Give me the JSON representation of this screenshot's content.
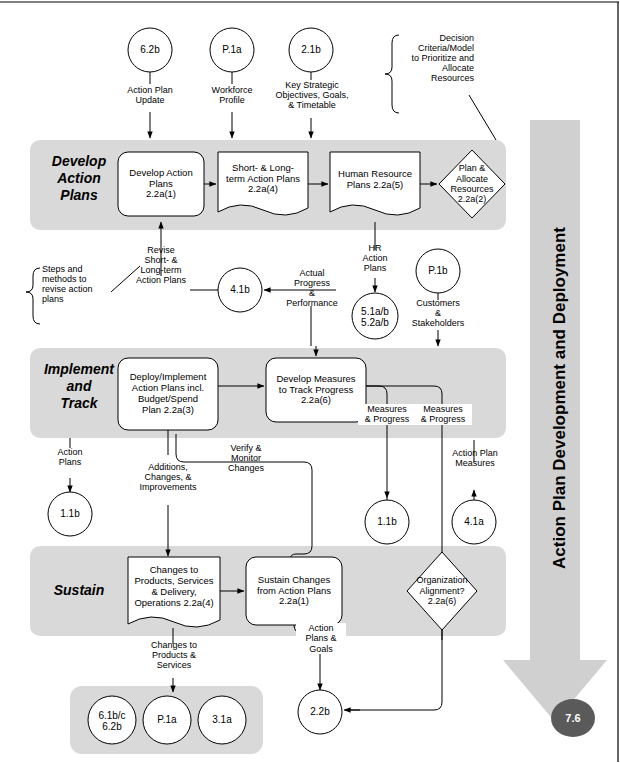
{
  "diagram": {
    "vertical_title": "Action Plan Development and Deployment",
    "end_node": "7.6",
    "colors": {
      "band_fill": "#d9d9d9",
      "arrow_fill": "#d0d0d0",
      "end_node_fill": "#5a5a5a",
      "node_stroke": "#000000",
      "node_fill": "#ffffff"
    }
  },
  "bands": [
    {
      "label": "Develop\nAction\nPlans"
    },
    {
      "label": "Implement\nand\nTrack"
    },
    {
      "label": "Sustain"
    }
  ],
  "band_labels": {
    "develop_l1": "Develop",
    "develop_l2": "Action",
    "develop_l3": "Plans",
    "implement_l1": "Implement",
    "implement_l2": "and",
    "implement_l3": "Track",
    "sustain": "Sustain"
  },
  "top_inputs": [
    {
      "id": "6.2b",
      "label": "Action Plan\nUpdate",
      "label_l1": "Action Plan",
      "label_l2": "Update"
    },
    {
      "id": "P.1a",
      "label": "Workforce\nProfile",
      "label_l1": "Workforce",
      "label_l2": "Profile"
    },
    {
      "id": "2.1b",
      "label": "Key Strategic\nObjectives, Goals,\n& Timetable",
      "label_l1": "Key Strategic",
      "label_l2": "Objectives, Goals,",
      "label_l3": "& Timetable"
    }
  ],
  "annotations": {
    "decision_criteria_l1": "Decision",
    "decision_criteria_l2": "Criteria/Model",
    "decision_criteria_l3": "to Prioritize and",
    "decision_criteria_l4": "Allocate",
    "decision_criteria_l5": "Resources",
    "steps_methods_l1": "Steps and",
    "steps_methods_l2": "methods to",
    "steps_methods_l3": "revise action",
    "steps_methods_l4": "plans"
  },
  "process_nodes": {
    "develop_action_plans": {
      "l1": "Develop Action",
      "l2": "Plans",
      "l3": "2.2a(1)"
    },
    "short_long_action_plans": {
      "l1": "Short- & Long-",
      "l2": "term Action Plans",
      "l3": "2.2a(4)"
    },
    "human_resource_plans": {
      "l1": "Human Resource",
      "l2": "Plans 2.2a(5)"
    },
    "plan_allocate_resources": {
      "l1": "Plan &",
      "l2": "Allocate",
      "l3": "Resources",
      "l4": "2.2a(2)"
    },
    "deploy_implement": {
      "l1": "Deploy/Implement",
      "l2": "Action Plans incl.",
      "l3": "Budget/Spend",
      "l4": "Plan 2.2a(3)"
    },
    "develop_measures": {
      "l1": "Develop Measures",
      "l2": "to Track Progress",
      "l3": "2.2a(6)"
    },
    "changes_to_products": {
      "l1": "Changes to",
      "l2": "Products, Services",
      "l3": "& Delivery,",
      "l4": "Operations 2.2a(4)"
    },
    "sustain_changes": {
      "l1": "Sustain Changes",
      "l2": "from Action Plans",
      "l3": "2.2a(1)"
    },
    "organization_alignment": {
      "l1": "Organization",
      "l2": "Alignment?",
      "l3": "2.2a(6)"
    }
  },
  "connector_circles": {
    "c_41b": "4.1b",
    "c_51ab_l1": "5.1a/b",
    "c_51ab_l2": "5.2a/b",
    "c_p1b": "P.1b",
    "c_11b_left": "1.1b",
    "c_11b_mid": "1.1b",
    "c_41a": "4.1a",
    "c_22b": "2.2b",
    "c_61bc_l1": "6.1b/c",
    "c_61bc_l2": "6.2b",
    "c_p1a_bottom": "P.1a",
    "c_31a": "3.1a"
  },
  "edge_labels": {
    "revise_plans_l1": "Revise",
    "revise_plans_l2": "Short- &",
    "revise_plans_l3": "Long-term",
    "revise_plans_l4": "Action Plans",
    "actual_progress_l1": "Actual",
    "actual_progress_l2": "Progress",
    "actual_progress_l3": "&",
    "actual_progress_l4": "Performance",
    "hr_action_plans_l1": "HR",
    "hr_action_plans_l2": "Action",
    "hr_action_plans_l3": "Plans",
    "customers_l1": "Customers",
    "customers_l2": "&",
    "customers_l3": "Stakeholders",
    "action_plans_l1": "Action",
    "action_plans_l2": "Plans",
    "additions_l1": "Additions,",
    "additions_l2": "Changes, &",
    "additions_l3": "Improvements",
    "verify_monitor_l1": "Verify &",
    "verify_monitor_l2": "Monitor",
    "verify_monitor_l3": "Changes",
    "measures_progress_a_l1": "Measures",
    "measures_progress_a_l2": "& Progress",
    "measures_progress_b_l1": "Measures",
    "measures_progress_b_l2": "& Progress",
    "action_plan_measures_l1": "Action Plan",
    "action_plan_measures_l2": "Measures",
    "changes_products_l1": "Changes to",
    "changes_products_l2": "Products &",
    "changes_products_l3": "Services",
    "action_plans_goals_l1": "Action",
    "action_plans_goals_l2": "Plans &",
    "action_plans_goals_l3": "Goals"
  }
}
